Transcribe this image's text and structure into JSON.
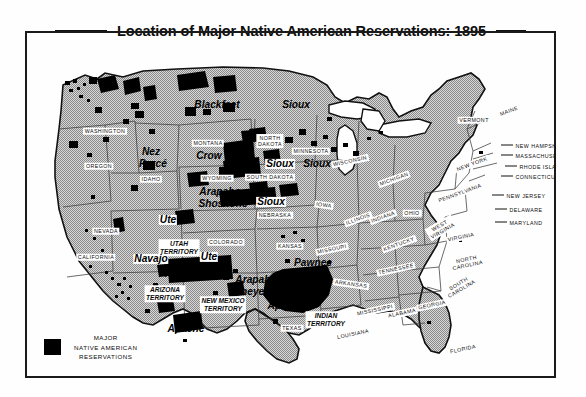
{
  "map": {
    "title": "Location of Major Native American Reservations: 1895",
    "colors": {
      "reservation_fill": "#000000",
      "land_fill": "#b9b9b9",
      "border": "#1a1a1a",
      "background": "#ffffff"
    }
  },
  "legend": {
    "swatch_color": "#000000",
    "line1": "MAJOR",
    "line2": "NATIVE AMERICAN",
    "line3": "RESERVATIONS"
  },
  "states": [
    {
      "name": "WASHINGTON",
      "x": 78,
      "y": 98
    },
    {
      "name": "OREGON",
      "x": 72,
      "y": 133
    },
    {
      "name": "IDAHO",
      "x": 124,
      "y": 146
    },
    {
      "name": "MONTANA",
      "x": 181,
      "y": 110
    },
    {
      "name": "WYOMING",
      "x": 190,
      "y": 145
    },
    {
      "name": "NEVADA",
      "x": 79,
      "y": 198
    },
    {
      "name": "CALIFORNIA",
      "x": 69,
      "y": 224
    },
    {
      "name": "COLORADO",
      "x": 199,
      "y": 209
    },
    {
      "name": "NORTH\nDAKOTA",
      "x": 243,
      "y": 108
    },
    {
      "name": "SOUTH DAKOTA",
      "x": 243,
      "y": 144
    },
    {
      "name": "NEBRASKA",
      "x": 248,
      "y": 182
    },
    {
      "name": "KANSAS",
      "x": 263,
      "y": 213
    },
    {
      "name": "MINNESOTA",
      "x": 284,
      "y": 118
    },
    {
      "name": "IOWA",
      "x": 297,
      "y": 172
    },
    {
      "name": "MISSOURI",
      "x": 305,
      "y": 216
    },
    {
      "name": "WISCONSIN",
      "x": 323,
      "y": 128
    },
    {
      "name": "ILLINOIS",
      "x": 331,
      "y": 186
    },
    {
      "name": "MICHIGAN",
      "x": 367,
      "y": 146
    },
    {
      "name": "INDIANA",
      "x": 356,
      "y": 184
    },
    {
      "name": "OHIO",
      "x": 385,
      "y": 180
    },
    {
      "name": "KENTUCKY",
      "x": 372,
      "y": 211
    },
    {
      "name": "TENNESSEE",
      "x": 369,
      "y": 236
    },
    {
      "name": "ARKANSAS",
      "x": 324,
      "y": 251
    },
    {
      "name": "MISSISSIPPI",
      "x": 348,
      "y": 277
    },
    {
      "name": "ALABAMA",
      "x": 375,
      "y": 280
    },
    {
      "name": "GEORGIA",
      "x": 405,
      "y": 272
    },
    {
      "name": "LOUISIANA",
      "x": 326,
      "y": 301
    },
    {
      "name": "TEXAS",
      "x": 265,
      "y": 295
    },
    {
      "name": "FLORIDA",
      "x": 436,
      "y": 316
    },
    {
      "name": "WEST\nVIRGINIA",
      "x": 414,
      "y": 195
    },
    {
      "name": "VIRGINIA",
      "x": 434,
      "y": 204
    },
    {
      "name": "NORTH\nCAROLINA",
      "x": 440,
      "y": 229
    },
    {
      "name": "SOUTH\nCAROLINA",
      "x": 433,
      "y": 253
    },
    {
      "name": "PENNSYLVANIA",
      "x": 433,
      "y": 160
    },
    {
      "name": "NEW YORK",
      "x": 445,
      "y": 131
    },
    {
      "name": "VERMONT",
      "x": 447,
      "y": 87
    },
    {
      "name": "MAINE",
      "x": 482,
      "y": 78
    }
  ],
  "callouts": [
    {
      "name": "NEW HAMPSHIRE",
      "tx": 487,
      "ty": 112,
      "lx": 474,
      "ly": 112,
      "lw": 12
    },
    {
      "name": "MASSACHUSETTS",
      "tx": 487,
      "ty": 122,
      "lx": 474,
      "ly": 122,
      "lw": 12
    },
    {
      "name": "RHODE ISLAND",
      "tx": 491,
      "ty": 133,
      "lx": 478,
      "ly": 133,
      "lw": 12
    },
    {
      "name": "CONNECTICUT",
      "tx": 487,
      "ty": 143,
      "lx": 474,
      "ly": 143,
      "lw": 12
    },
    {
      "name": "NEW JERSEY",
      "tx": 478,
      "ty": 162,
      "lx": 465,
      "ly": 162,
      "lw": 12
    },
    {
      "name": "DELAWARE",
      "tx": 481,
      "ty": 176,
      "lx": 468,
      "ly": 176,
      "lw": 12
    },
    {
      "name": "MARYLAND",
      "tx": 481,
      "ty": 189,
      "lx": 468,
      "ly": 189,
      "lw": 12
    }
  ],
  "territories": [
    {
      "name": "UTAH\nTERRITORY",
      "x": 152,
      "y": 215
    },
    {
      "name": "ARIZONA\nTERRITORY",
      "x": 138,
      "y": 261
    },
    {
      "name": "NEW MEXICO\nTERRITORY",
      "x": 196,
      "y": 272
    },
    {
      "name": "INDIAN\nTERRITORY",
      "x": 299,
      "y": 287
    }
  ],
  "tribes": [
    {
      "name": "Blackfeet",
      "x": 190,
      "y": 72,
      "size": "lg",
      "boxed": false
    },
    {
      "name": "Sioux",
      "x": 269,
      "y": 72,
      "size": "lg",
      "boxed": false
    },
    {
      "name": "Crow",
      "x": 182,
      "y": 123,
      "size": "lg",
      "boxed": false
    },
    {
      "name": "Nez",
      "x": 124,
      "y": 119,
      "size": "lg",
      "boxed": false
    },
    {
      "name": "Percé",
      "x": 126,
      "y": 131,
      "size": "lg",
      "boxed": false
    },
    {
      "name": "Sioux",
      "x": 253,
      "y": 131,
      "size": "lg",
      "boxed": true
    },
    {
      "name": "Sioux",
      "x": 290,
      "y": 131,
      "size": "lg",
      "boxed": false
    },
    {
      "name": "Sioux",
      "x": 244,
      "y": 169,
      "size": "lg",
      "boxed": true
    },
    {
      "name": "Arapaho",
      "x": 193,
      "y": 159,
      "size": "lg",
      "boxed": false
    },
    {
      "name": "Shoshone",
      "x": 196,
      "y": 171,
      "size": "lg",
      "boxed": false
    },
    {
      "name": "Ute",
      "x": 141,
      "y": 187,
      "size": "lg",
      "boxed": true
    },
    {
      "name": "Ute",
      "x": 182,
      "y": 224,
      "size": "lg",
      "boxed": true
    },
    {
      "name": "Navajo",
      "x": 124,
      "y": 226,
      "size": "lg",
      "boxed": true
    },
    {
      "name": "Hopi",
      "x": 149,
      "y": 241,
      "size": "lg",
      "boxed": false
    },
    {
      "name": "Apache",
      "x": 159,
      "y": 296,
      "size": "lg",
      "boxed": false
    },
    {
      "name": "Apache",
      "x": 259,
      "y": 273,
      "size": "lg",
      "boxed": false
    },
    {
      "name": "Arapaho",
      "x": 229,
      "y": 247,
      "size": "lg",
      "boxed": false
    },
    {
      "name": "Cheyenne",
      "x": 231,
      "y": 259,
      "size": "lg",
      "boxed": false
    },
    {
      "name": "Pawnee",
      "x": 286,
      "y": 230,
      "size": "lg",
      "boxed": false
    }
  ]
}
